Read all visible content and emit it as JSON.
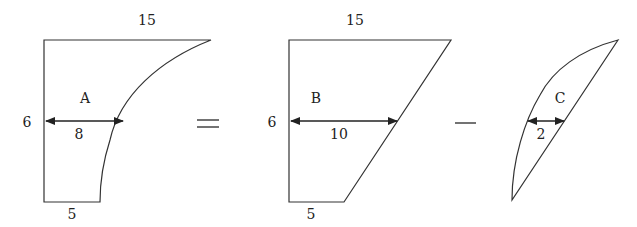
{
  "diagram": {
    "shapes": {
      "A": {
        "name": "A",
        "top_label": "15",
        "side_label": "6",
        "width_label": "8",
        "bottom_label": "5"
      },
      "B": {
        "name": "B",
        "top_label": "15",
        "side_label": "6",
        "width_label": "10",
        "bottom_label": "5"
      },
      "C": {
        "name": "C",
        "width_label": "2"
      }
    },
    "operators": {
      "equals": "=",
      "minus": "−"
    }
  }
}
